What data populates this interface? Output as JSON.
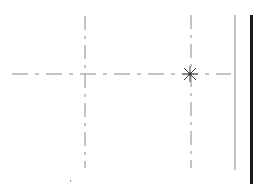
{
  "drawing": {
    "background": "#ffffff",
    "colors": {
      "centerline": "#8a8a8a",
      "marker": "#444444",
      "edge_line": "#9a9a9a",
      "border": "#1a1a1a"
    },
    "horizontal_centerline": {
      "y": 74,
      "x1": 12,
      "x2": 231
    },
    "vertical_centerlines": [
      {
        "x": 85,
        "y1": 16,
        "y2": 168
      },
      {
        "x": 191,
        "y1": 15,
        "y2": 168
      }
    ],
    "marker": {
      "type": "asterisk",
      "x": 190,
      "y": 74,
      "size": 8
    },
    "edge_line": {
      "x": 235,
      "y1": 15,
      "y2": 170
    },
    "border_line": {
      "x": 251,
      "y1": 15,
      "y2": 184
    },
    "speck": {
      "x": 70,
      "y": 180
    }
  }
}
